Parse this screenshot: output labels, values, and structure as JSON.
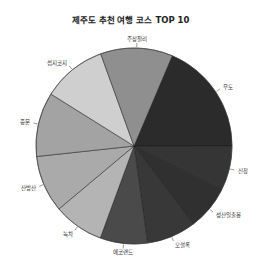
{
  "chart_data": {
    "type": "pie",
    "title": "제주도 추천 여행 코스 TOP 10",
    "start_angle_deg": 23,
    "direction": "clockwise",
    "categories": [
      "우도",
      "신창",
      "성산일출봉",
      "오설록",
      "에코랜드",
      "녹차",
      "산방산",
      "중문",
      "섭지코지",
      "주상절리"
    ],
    "values": [
      18.6,
      7.5,
      7.2,
      8.1,
      7.8,
      8.3,
      9.4,
      10.6,
      10.6,
      11.9
    ],
    "colors": [
      "#2b2b2b",
      "#353535",
      "#303030",
      "#383838",
      "#4a4a4a",
      "#b4b4b4",
      "#aaaaaa",
      "#a3a3a3",
      "#cfcfcf",
      "#8f8f8f"
    ],
    "legend": "none",
    "labels_outside": true
  }
}
